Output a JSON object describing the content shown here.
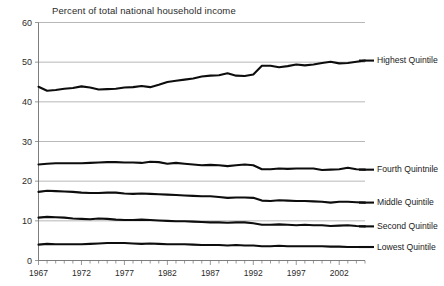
{
  "chart_data": {
    "type": "line",
    "title": "Percent of total national household income",
    "xlabel": "",
    "ylabel": "",
    "ylim": [
      0,
      60
    ],
    "xlim": [
      1967,
      2005
    ],
    "yticks": [
      0,
      10,
      20,
      30,
      40,
      50,
      60
    ],
    "xticks": [
      1967,
      1972,
      1977,
      1982,
      1987,
      1992,
      1997,
      2002
    ],
    "grid": true,
    "legend_position": "right-inline-labels",
    "x": [
      1967,
      1968,
      1969,
      1970,
      1971,
      1972,
      1973,
      1974,
      1975,
      1976,
      1977,
      1978,
      1979,
      1980,
      1981,
      1982,
      1983,
      1984,
      1985,
      1986,
      1987,
      1988,
      1989,
      1990,
      1991,
      1992,
      1993,
      1994,
      1995,
      1996,
      1997,
      1998,
      1999,
      2000,
      2001,
      2002,
      2003,
      2004,
      2005
    ],
    "series": [
      {
        "name": "Highest Quintile",
        "label": "Highest Quintile",
        "color": "#0d0d0d",
        "values": [
          43.8,
          42.8,
          43.0,
          43.3,
          43.5,
          43.9,
          43.6,
          43.1,
          43.2,
          43.3,
          43.6,
          43.7,
          44.0,
          43.7,
          44.3,
          45.0,
          45.3,
          45.6,
          45.9,
          46.4,
          46.6,
          46.7,
          47.2,
          46.6,
          46.5,
          46.9,
          49.1,
          49.1,
          48.7,
          49.0,
          49.4,
          49.2,
          49.4,
          49.8,
          50.1,
          49.7,
          49.8,
          50.1,
          50.4
        ],
        "end_value": 50.4
      },
      {
        "name": "Fourth Quintile",
        "label": "Fourth Quintnile",
        "color": "#0d0d0d",
        "values": [
          24.2,
          24.4,
          24.5,
          24.5,
          24.5,
          24.5,
          24.6,
          24.7,
          24.8,
          24.8,
          24.7,
          24.7,
          24.6,
          24.9,
          24.8,
          24.4,
          24.6,
          24.4,
          24.2,
          24.0,
          24.1,
          24.0,
          23.8,
          24.0,
          24.2,
          24.0,
          23.0,
          23.0,
          23.2,
          23.1,
          23.2,
          23.2,
          23.2,
          22.8,
          22.9,
          23.0,
          23.4,
          23.0,
          22.9
        ],
        "end_value": 22.9
      },
      {
        "name": "Middle Quintile",
        "label": "Middle Quintile",
        "color": "#0d0d0d",
        "values": [
          17.3,
          17.6,
          17.5,
          17.4,
          17.3,
          17.1,
          17.0,
          17.0,
          17.1,
          17.1,
          16.9,
          16.8,
          16.9,
          16.8,
          16.7,
          16.6,
          16.5,
          16.4,
          16.3,
          16.2,
          16.2,
          16.0,
          15.8,
          15.9,
          15.9,
          15.8,
          15.1,
          15.0,
          15.2,
          15.1,
          15.0,
          15.0,
          14.9,
          14.8,
          14.6,
          14.8,
          14.8,
          14.7,
          14.6
        ],
        "end_value": 14.6
      },
      {
        "name": "Second Quintile",
        "label": "Second Quintile",
        "color": "#0d0d0d",
        "values": [
          10.8,
          11.0,
          10.9,
          10.8,
          10.6,
          10.5,
          10.4,
          10.6,
          10.5,
          10.3,
          10.2,
          10.2,
          10.3,
          10.2,
          10.1,
          10.0,
          9.9,
          9.9,
          9.8,
          9.7,
          9.6,
          9.6,
          9.5,
          9.6,
          9.6,
          9.4,
          9.0,
          9.0,
          9.1,
          9.0,
          8.9,
          9.0,
          8.9,
          8.9,
          8.7,
          8.8,
          8.9,
          8.7,
          8.6
        ],
        "end_value": 8.6
      },
      {
        "name": "Lowest Quintile",
        "label": "Lowest Quintile",
        "color": "#0d0d0d",
        "values": [
          4.0,
          4.2,
          4.1,
          4.1,
          4.1,
          4.1,
          4.2,
          4.3,
          4.4,
          4.4,
          4.4,
          4.3,
          4.2,
          4.3,
          4.2,
          4.1,
          4.1,
          4.1,
          4.0,
          3.9,
          3.9,
          3.9,
          3.8,
          3.9,
          3.8,
          3.8,
          3.6,
          3.6,
          3.7,
          3.6,
          3.6,
          3.6,
          3.6,
          3.6,
          3.5,
          3.5,
          3.4,
          3.4,
          3.4
        ],
        "end_value": 3.4
      }
    ]
  }
}
